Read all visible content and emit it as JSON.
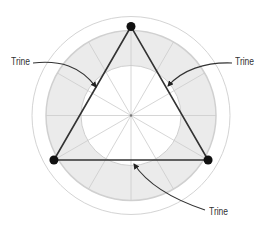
{
  "diagram": {
    "type": "astrological aspect chart",
    "aspect": "Trine",
    "center": [
      131,
      115.5
    ],
    "outer_circle_radius": 99,
    "ring_outer_radius": 85,
    "inner_circle_radius": 50,
    "spoke_count": 12,
    "planet_radius": 89,
    "planet_angles_deg": [
      90,
      210,
      330
    ],
    "colors": {
      "ring_fill": "#ebebeb",
      "lines": "#cccccc",
      "triangle": "#333333",
      "planet": "#111111"
    }
  },
  "labels": [
    {
      "text": "Trine",
      "x": 11,
      "y": 56
    },
    {
      "text": "Trine",
      "x": 235,
      "y": 56
    },
    {
      "text": "Trine",
      "x": 209,
      "y": 206
    }
  ]
}
